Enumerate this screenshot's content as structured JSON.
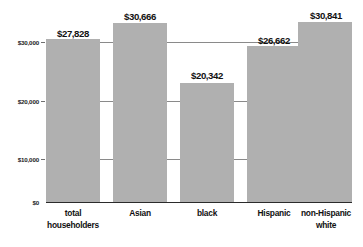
{
  "chart_data": {
    "type": "bar",
    "title": "",
    "xlabel": "",
    "ylabel": "",
    "categories": [
      "total householders",
      "Asian",
      "black",
      "Hispanic",
      "non-Hispanic white"
    ],
    "category_lines": [
      [
        "total",
        "householders"
      ],
      [
        "Asian"
      ],
      [
        "black"
      ],
      [
        "Hispanic"
      ],
      [
        "non-Hispanic",
        "white"
      ]
    ],
    "values": [
      27828,
      30666,
      20342,
      26662,
      30841
    ],
    "value_labels": [
      "$27,828",
      "$30,666",
      "$20,342",
      "$26,662",
      "$30,841"
    ],
    "ylim": [
      0,
      31500
    ],
    "yticks": [
      0,
      10000,
      20000,
      30000
    ],
    "ytick_labels": [
      "$0",
      "$10,000",
      "$20,000",
      "$30,000"
    ],
    "grid": true,
    "legend": false,
    "bar_color": "#b0b0b0",
    "gridline_color": "#8a8a8a",
    "axis_color": "#2b2b2b",
    "text_color": "#111111",
    "background": "#ffffff"
  }
}
